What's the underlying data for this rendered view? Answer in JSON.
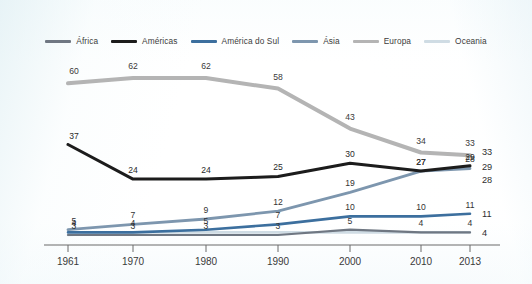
{
  "chart_data": {
    "type": "line",
    "title": "",
    "subtitle": "",
    "xlabel": "",
    "ylabel": "",
    "x": [
      "1961",
      "1970",
      "1980",
      "1990",
      "2000",
      "2010",
      "2013"
    ],
    "xlim": [
      1961,
      2013
    ],
    "ylim": [
      0,
      70
    ],
    "grid": false,
    "legend_position": "top-center",
    "series": [
      {
        "name": "África",
        "color": "#6f7782",
        "values": [
          3,
          3,
          3,
          3,
          5,
          4,
          4
        ],
        "labels": [
          "3",
          "3",
          "3",
          "3",
          "5",
          "4",
          "4"
        ],
        "end_label": "4"
      },
      {
        "name": "Américas",
        "color": "#1c1c1c",
        "values": [
          37,
          24,
          24,
          25,
          30,
          27,
          29
        ],
        "labels": [
          "37",
          "24",
          "24",
          "25",
          "30",
          "27",
          "29"
        ],
        "end_label": "29"
      },
      {
        "name": "América do Sul",
        "color": "#3c6f9e",
        "values": [
          4,
          4,
          5,
          7,
          10,
          10,
          11
        ],
        "labels": [
          "4",
          "4",
          "5",
          "7",
          "10",
          "10",
          "11"
        ],
        "end_label": "11"
      },
      {
        "name": "Ásia",
        "color": "#7d96ae",
        "values": [
          5,
          7,
          9,
          12,
          19,
          27,
          28
        ],
        "labels": [
          "5",
          "7",
          "9",
          "12",
          "19",
          "27",
          "28"
        ],
        "end_label": "28"
      },
      {
        "name": "Europa",
        "color": "#b4b4b4",
        "values": [
          60,
          62,
          62,
          58,
          43,
          34,
          33
        ],
        "labels": [
          "60",
          "62",
          "62",
          "58",
          "43",
          "34",
          "33"
        ],
        "end_label": "33"
      },
      {
        "name": "Oceania",
        "color": "#cfdce4",
        "values": [
          3,
          4,
          4,
          4,
          4,
          4,
          4
        ],
        "labels": [
          "",
          "",
          "",
          "",
          "",
          "",
          ""
        ],
        "end_label": ""
      }
    ]
  },
  "axis": {
    "ticks": [
      "1961",
      "1970",
      "1980",
      "1990",
      "2000",
      "2010",
      "2013"
    ],
    "axis_color": "#6b6b6b"
  },
  "legend": {
    "items": [
      {
        "label": "África",
        "color": "#6f7782"
      },
      {
        "label": "Américas",
        "color": "#1c1c1c"
      },
      {
        "label": "América do Sul",
        "color": "#3c6f9e"
      },
      {
        "label": "Ásia",
        "color": "#7d96ae"
      },
      {
        "label": "Europa",
        "color": "#b4b4b4"
      },
      {
        "label": "Oceania",
        "color": "#cfdce4"
      }
    ]
  }
}
